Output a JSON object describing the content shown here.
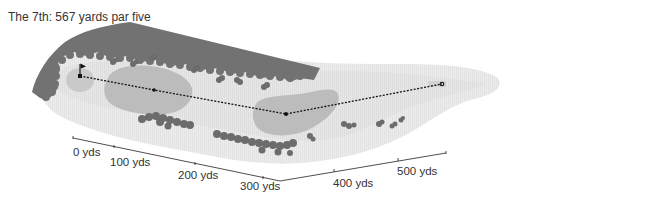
{
  "title": "The 7th: 567 yards par five",
  "hole": {
    "number": "7th",
    "length_yards": 567,
    "par": 5
  },
  "colors": {
    "rough": "#e8e8e8",
    "fairway": "#dcdcdc",
    "bunker_area": "#b9b9b9",
    "green": "#c6c6c6",
    "trees": "#6e6e6e",
    "tree_band": "#747474",
    "route": "#111111",
    "text": "#333333"
  },
  "route": {
    "points": [
      {
        "name": "pin",
        "x": 80,
        "y": 76
      },
      {
        "name": "waypoint-1",
        "x": 154,
        "y": 90
      },
      {
        "name": "waypoint-2",
        "x": 286,
        "y": 114
      },
      {
        "name": "tee",
        "x": 442,
        "y": 84
      }
    ]
  },
  "axis_near": {
    "ticks": [
      {
        "label": "0 yds",
        "x": 73,
        "y": 139
      },
      {
        "label": "100 yds",
        "x": 141,
        "y": 153
      },
      {
        "label": "200 yds",
        "x": 209,
        "y": 167
      },
      {
        "label": "300 yds",
        "x": 260,
        "y": 177
      }
    ]
  },
  "axis_far": {
    "ticks": [
      {
        "label": "400 yds",
        "x": 334,
        "y": 172
      },
      {
        "label": "500 yds",
        "x": 411,
        "y": 159
      }
    ]
  }
}
